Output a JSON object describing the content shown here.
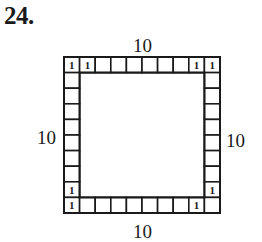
{
  "problem": {
    "number": "24."
  },
  "labels": {
    "top": "10",
    "left": "10",
    "right": "10",
    "bottom": "10"
  },
  "grid": {
    "columns": 10,
    "rows": 10,
    "origin_x": 64,
    "origin_y": 57,
    "cell_size": 15.6,
    "stroke_color": "#1a1a1a",
    "marked_value": "1",
    "marked_cells": [
      [
        0,
        0
      ],
      [
        0,
        1
      ],
      [
        0,
        8
      ],
      [
        0,
        9
      ],
      [
        8,
        0
      ],
      [
        9,
        0
      ],
      [
        8,
        9
      ],
      [
        9,
        8
      ]
    ]
  }
}
